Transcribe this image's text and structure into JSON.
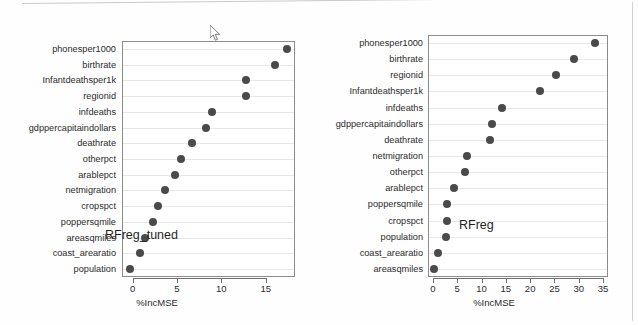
{
  "page": {
    "background_color": "#fefefe",
    "frame_color": "#c9c9c9"
  },
  "cursor": {
    "name": "mouse-pointer",
    "x": 210,
    "y": 25
  },
  "chart_data": [
    {
      "type": "scatter",
      "id": "left",
      "title": "RFreg_tuned",
      "xlabel": "%IncMSE",
      "ylabel": "",
      "xlim": [
        -1.2,
        18.3
      ],
      "xticks": [
        0,
        5,
        10,
        15
      ],
      "xticklabels": [
        "0",
        "5",
        "10",
        "15"
      ],
      "grid": true,
      "grid_axis": "y",
      "marker_color": "#4a4a4a",
      "categories": [
        "phonesper1000",
        "birthrate",
        "Infantdeathsper1k",
        "regionid",
        "infdeaths",
        "gdppercapitaindollars",
        "deathrate",
        "otherpct",
        "arablepct",
        "netmigration",
        "cropspct",
        "poppersqmile",
        "areasqmiles",
        "coast_arearatio",
        "population"
      ],
      "values": [
        17.4,
        16.1,
        12.8,
        12.8,
        9.0,
        8.3,
        6.7,
        5.4,
        4.8,
        3.6,
        2.9,
        2.3,
        1.4,
        0.8,
        -0.3
      ]
    },
    {
      "type": "scatter",
      "id": "right",
      "title": "RFreg",
      "xlabel": "%IncMSE",
      "ylabel": "",
      "xlim": [
        -1.0,
        36.0
      ],
      "xticks": [
        0,
        5,
        10,
        15,
        20,
        25,
        30,
        35
      ],
      "xticklabels": [
        "0",
        "5",
        "10",
        "15",
        "20",
        "25",
        "30",
        "35"
      ],
      "grid": true,
      "grid_axis": "y",
      "marker_color": "#4a4a4a",
      "categories": [
        "phonesper1000",
        "birthrate",
        "regionid",
        "Infantdeathsper1k",
        "infdeaths",
        "gdppercapitaindollars",
        "deathrate",
        "netmigration",
        "otherpct",
        "arablepct",
        "poppersqmile",
        "cropspct",
        "population",
        "coast_arearatio",
        "areasqmiles"
      ],
      "values": [
        33.3,
        29.0,
        25.3,
        22.0,
        14.2,
        12.2,
        11.8,
        7.1,
        6.7,
        4.4,
        3.0,
        3.0,
        2.6,
        1.0,
        0.2
      ]
    }
  ]
}
